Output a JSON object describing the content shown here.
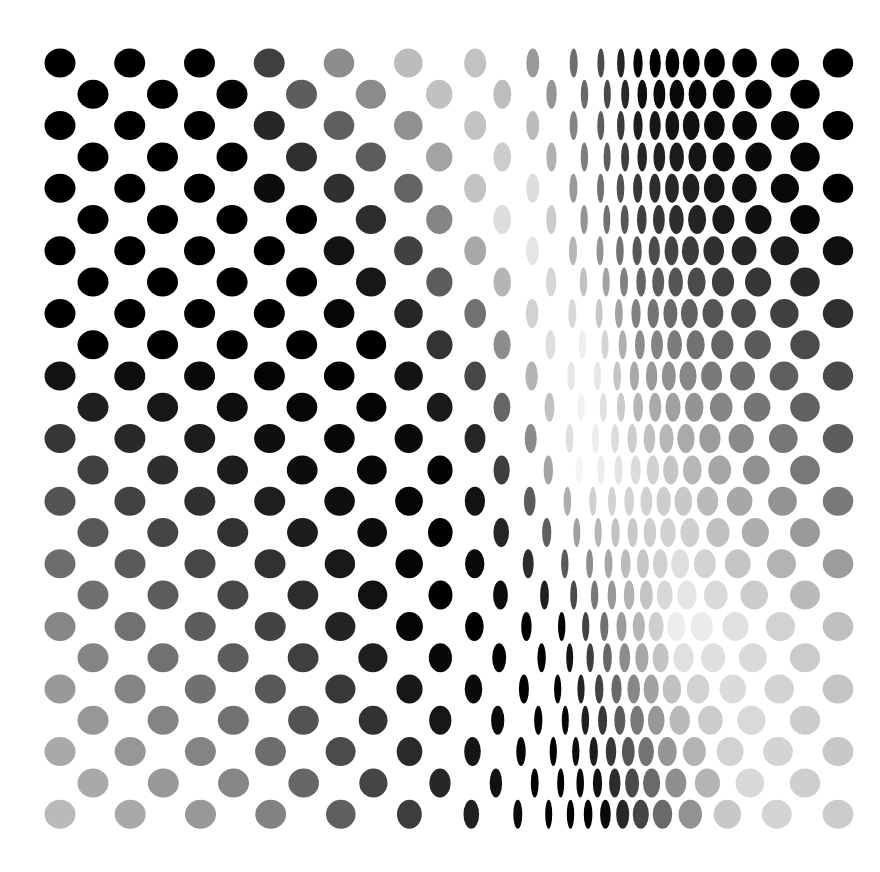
{
  "artwork": {
    "title": "Op-art dot field",
    "background": "#ffffff",
    "dot_color_dark": "#000000",
    "dot_color_light": "#ffffff"
  },
  "grid": {
    "rows": 25,
    "row_y_start": 63,
    "row_y_step": 31.3,
    "base_spacing": 65,
    "dot_height": 29,
    "left_start_even": 60,
    "left_start_odd": 93,
    "right_edge": 838
  },
  "compression": {
    "comment_free": true,
    "center_top": 600,
    "center_bottom": 555,
    "min_width": 7,
    "max_width": 31,
    "falloff": 150
  },
  "tone_keyframes": [
    {
      "row": 0,
      "stops": [
        [
          40,
          0.0
        ],
        [
          230,
          0.0
        ],
        [
          300,
          0.45
        ],
        [
          440,
          0.82
        ],
        [
          500,
          0.72
        ],
        [
          560,
          0.5
        ],
        [
          600,
          0.3
        ],
        [
          640,
          0.0
        ],
        [
          840,
          0.0
        ]
      ]
    },
    {
      "row": 5,
      "stops": [
        [
          40,
          0.0
        ],
        [
          300,
          0.0
        ],
        [
          400,
          0.25
        ],
        [
          480,
          0.8
        ],
        [
          530,
          0.95
        ],
        [
          580,
          0.6
        ],
        [
          640,
          0.25
        ],
        [
          720,
          0.1
        ],
        [
          840,
          0.0
        ]
      ]
    },
    {
      "row": 9,
      "stops": [
        [
          40,
          0.0
        ],
        [
          380,
          0.0
        ],
        [
          470,
          0.3
        ],
        [
          540,
          0.85
        ],
        [
          590,
          0.95
        ],
        [
          640,
          0.55
        ],
        [
          720,
          0.4
        ],
        [
          840,
          0.25
        ]
      ]
    },
    {
      "row": 13,
      "stops": [
        [
          40,
          0.3
        ],
        [
          300,
          0.05
        ],
        [
          460,
          0.0
        ],
        [
          520,
          0.35
        ],
        [
          580,
          0.97
        ],
        [
          640,
          0.85
        ],
        [
          740,
          0.6
        ],
        [
          840,
          0.4
        ]
      ]
    },
    {
      "row": 18,
      "stops": [
        [
          40,
          0.55
        ],
        [
          250,
          0.3
        ],
        [
          420,
          0.0
        ],
        [
          560,
          0.0
        ],
        [
          620,
          0.6
        ],
        [
          680,
          0.95
        ],
        [
          760,
          0.85
        ],
        [
          840,
          0.75
        ]
      ]
    },
    {
      "row": 24,
      "stops": [
        [
          40,
          0.75
        ],
        [
          250,
          0.55
        ],
        [
          430,
          0.2
        ],
        [
          540,
          0.0
        ],
        [
          600,
          0.0
        ],
        [
          660,
          0.4
        ],
        [
          740,
          0.85
        ],
        [
          840,
          0.8
        ]
      ]
    }
  ]
}
